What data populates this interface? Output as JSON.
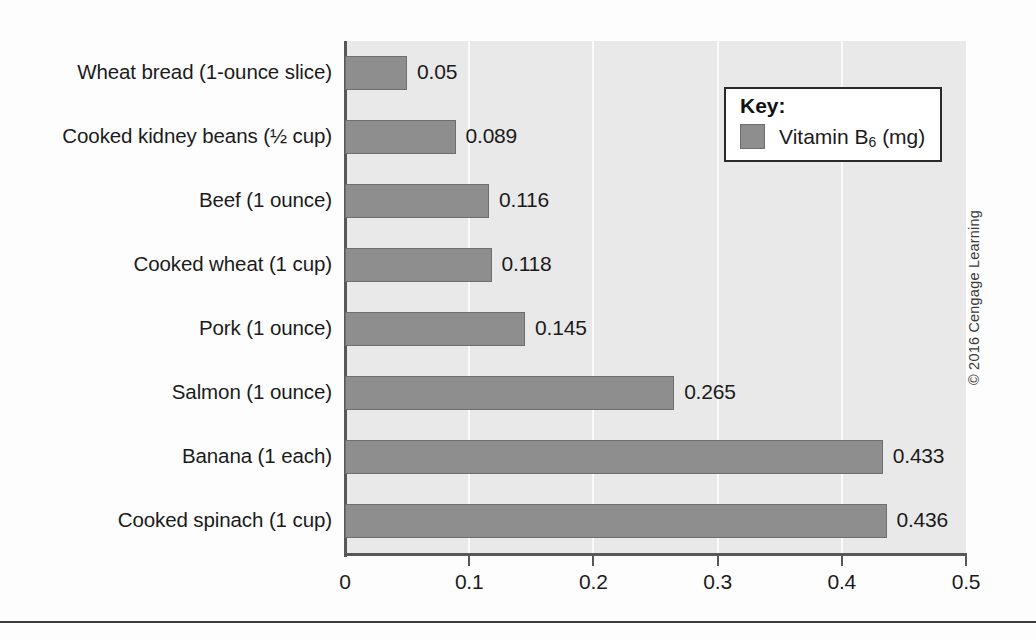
{
  "figure": {
    "copyright": "© 2016 Cengage Learning"
  },
  "legend": {
    "title": "Key:",
    "entry_label_prefix": "Vitamin B",
    "entry_label_sub": "6",
    "entry_label_suffix": " (mg)",
    "swatch_color": "#8e8e8e"
  },
  "axis": {
    "x_ticks": [
      "0",
      "0.1",
      "0.2",
      "0.3",
      "0.4",
      "0.5"
    ]
  },
  "chart_data": {
    "type": "bar",
    "orientation": "horizontal",
    "title": "",
    "xlabel": "",
    "ylabel": "",
    "xlim": [
      0,
      0.5
    ],
    "grid": true,
    "grid_axis": "x",
    "legend_position": "top-right",
    "series_name": "Vitamin B6 (mg)",
    "unit": "mg",
    "categories": [
      "Wheat bread (1-ounce slice)",
      "Cooked kidney beans (½ cup)",
      "Beef (1 ounce)",
      "Cooked wheat (1 cup)",
      "Pork (1 ounce)",
      "Salmon (1 ounce)",
      "Banana (1 each)",
      "Cooked spinach (1 cup)"
    ],
    "values": [
      0.05,
      0.089,
      0.116,
      0.118,
      0.145,
      0.265,
      0.433,
      0.436
    ],
    "value_labels": [
      "0.05",
      "0.089",
      "0.116",
      "0.118",
      "0.145",
      "0.265",
      "0.433",
      "0.436"
    ],
    "bar_color": "#8e8e8e",
    "bar_edge_color": "#6e6e6e",
    "plot_background": "#e9e9e9"
  }
}
